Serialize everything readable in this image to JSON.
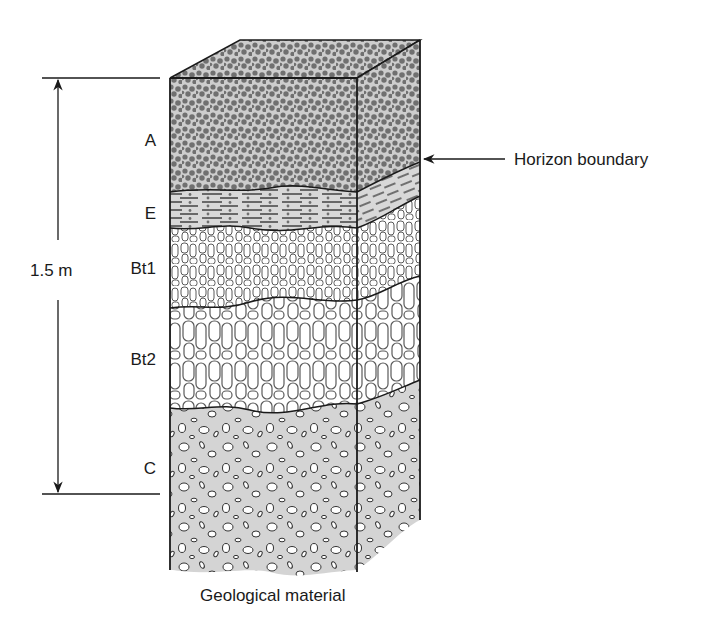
{
  "diagram": {
    "type": "soil-profile-block",
    "scale": {
      "label": "1.5 m",
      "top_y": 78,
      "bottom_y": 494
    },
    "horizons": [
      {
        "id": "A",
        "label": "A",
        "texture": "granular-dots",
        "color": "#6e6e6e",
        "bg": "#cfcfcf"
      },
      {
        "id": "E",
        "label": "E",
        "texture": "platy-dashes",
        "color": "#2a2a2a",
        "bg": "#d6d6d6"
      },
      {
        "id": "Bt1",
        "label": "Bt1",
        "texture": "fine-prismatic",
        "color": "#555555",
        "bg": "#ffffff"
      },
      {
        "id": "Bt2",
        "label": "Bt2",
        "texture": "coarse-prismatic",
        "color": "#555555",
        "bg": "#ffffff"
      },
      {
        "id": "C",
        "label": "C",
        "texture": "gravelly",
        "color": "#333333",
        "bg": "#d3d3d3"
      }
    ],
    "annotations": {
      "horizon_boundary": "Horizon boundary",
      "base": "Geological material"
    }
  },
  "colors": {
    "line": "#1a1a1a",
    "A_dot": "#707070",
    "A_bg": "#cdcdcd",
    "E_bg": "#d8d8d8",
    "C_bg": "#d4d4d4",
    "prism_line": "#5a5a5a"
  }
}
